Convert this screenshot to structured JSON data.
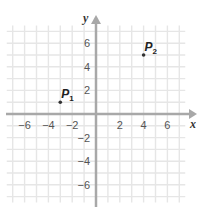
{
  "chart_data": {
    "type": "scatter",
    "title": "",
    "xlabel": "x",
    "ylabel": "y",
    "xlim": [
      -7.5,
      7.5
    ],
    "ylim": [
      -7.5,
      7.5
    ],
    "grid": true,
    "x_ticks": [
      -6,
      -4,
      -2,
      2,
      4,
      6
    ],
    "y_ticks": [
      6,
      4,
      2,
      -2,
      -4,
      -6
    ],
    "x_tick_labels": [
      "−6",
      "−4",
      "−2",
      "2",
      "4",
      "6"
    ],
    "y_tick_labels": [
      "6",
      "4",
      "2",
      "−2",
      "−4",
      "−6"
    ],
    "points": [
      {
        "name": "P",
        "sub": "1",
        "x": -3,
        "y": 1
      },
      {
        "name": "P",
        "sub": "2",
        "x": 4,
        "y": 5
      }
    ]
  },
  "colors": {
    "grid": "#e6e6e6",
    "axis": "#a8a8a8",
    "point": "#333333"
  }
}
